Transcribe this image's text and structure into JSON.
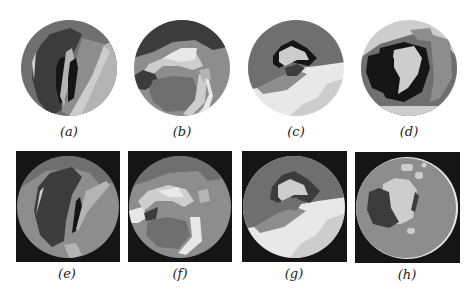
{
  "figure": {
    "colors": {
      "black": "#151515",
      "dark": "#3c3c3c",
      "mid_dark": "#6f6f6f",
      "mid": "#8d8d8d",
      "light": "#b4b4b4",
      "lighter": "#cdcdcd",
      "white": "#e8e8e8",
      "background": "#ffffff"
    },
    "top_row": [
      {
        "id": "a",
        "caption": "(a)"
      },
      {
        "id": "b",
        "caption": "(b)"
      },
      {
        "id": "c",
        "caption": "(c)"
      },
      {
        "id": "d",
        "caption": "(d)"
      }
    ],
    "bottom_row": [
      {
        "id": "e",
        "caption": "(e)"
      },
      {
        "id": "f",
        "caption": "(f)"
      },
      {
        "id": "g",
        "caption": "(g)"
      },
      {
        "id": "h",
        "caption": "(h)"
      }
    ]
  }
}
